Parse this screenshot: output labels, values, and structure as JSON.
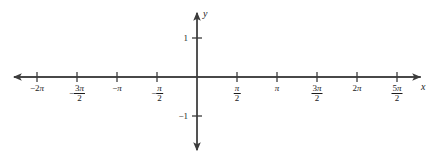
{
  "figure": {
    "background_color": "#ffffff",
    "axis_color": "#3c3c3c",
    "text_color": "#1b1b1b"
  },
  "axes": {
    "x_axis_label": "x",
    "y_axis_label": "y",
    "x_arrow_left": "arrow-left-icon",
    "x_arrow_right": "arrow-right-icon",
    "y_arrow_up": "arrow-up-icon",
    "y_arrow_down": "arrow-down-icon"
  },
  "chart_data": {
    "type": "line",
    "title": "",
    "subtitle": "",
    "xlabel": "x",
    "ylabel": "y",
    "grid": false,
    "legend": "none",
    "series": [],
    "xlim": [
      -6.806784,
      8.37758
    ],
    "ylim": [
      -1.925,
      1.425
    ],
    "x_ticks": [
      {
        "value": -6.283185,
        "label": "-2π",
        "kind": "simple",
        "sign": "−",
        "integer": "2",
        "symbol": "π"
      },
      {
        "value": -4.712389,
        "label": "-3π/2",
        "kind": "fraction",
        "sign": "−",
        "numerator_coefficient": "3",
        "numerator_symbol": "π",
        "denominator": "2"
      },
      {
        "value": -3.141593,
        "label": "-π",
        "kind": "simple",
        "sign": "−",
        "integer": "",
        "symbol": "π"
      },
      {
        "value": -1.570796,
        "label": "-π/2",
        "kind": "fraction",
        "sign": "−",
        "numerator_coefficient": "",
        "numerator_symbol": "π",
        "denominator": "2"
      },
      {
        "value": 1.570796,
        "label": "π/2",
        "kind": "fraction",
        "sign": "",
        "numerator_coefficient": "",
        "numerator_symbol": "π",
        "denominator": "2"
      },
      {
        "value": 3.141593,
        "label": "π",
        "kind": "simple",
        "sign": "",
        "integer": "",
        "symbol": "π"
      },
      {
        "value": 4.712389,
        "label": "3π/2",
        "kind": "fraction",
        "sign": "",
        "numerator_coefficient": "3",
        "numerator_symbol": "π",
        "denominator": "2"
      },
      {
        "value": 6.283185,
        "label": "2π",
        "kind": "simple",
        "sign": "",
        "integer": "2",
        "symbol": "π"
      },
      {
        "value": 7.853982,
        "label": "5π/2",
        "kind": "fraction",
        "sign": "",
        "numerator_coefficient": "5",
        "numerator_symbol": "π",
        "denominator": "2"
      }
    ],
    "y_ticks": [
      {
        "value": 1,
        "label": "1"
      },
      {
        "value": -1,
        "label": "-1"
      }
    ]
  }
}
